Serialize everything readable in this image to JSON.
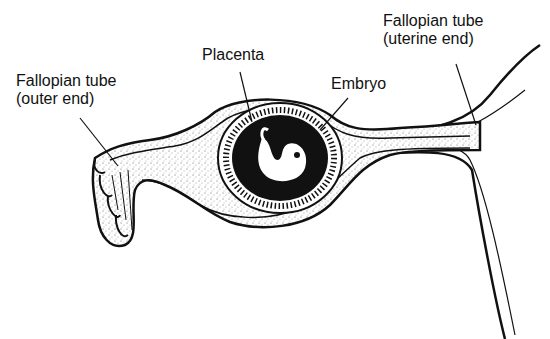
{
  "diagram": {
    "labels": {
      "outer_end_line1": "Fallopian tube",
      "outer_end_line2": "(outer end)",
      "placenta": "Placenta",
      "embryo": "Embryo",
      "uterine_end_line1": "Fallopian tube",
      "uterine_end_line2": "(uterine end)"
    },
    "colors": {
      "ink": "#111111",
      "background": "#ffffff",
      "stipple": "#9a9a9a"
    }
  }
}
